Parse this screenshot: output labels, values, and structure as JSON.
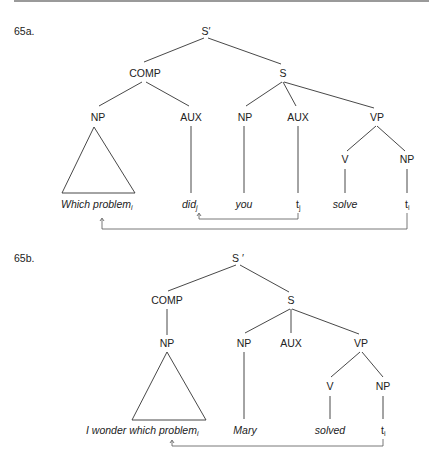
{
  "examples": [
    {
      "label": "65a.",
      "nodes": {
        "root": "S′",
        "comp": "COMP",
        "s": "S",
        "comp_np": "NP",
        "comp_aux": "AUX",
        "s_np": "NP",
        "s_aux": "AUX",
        "vp": "VP",
        "v": "V",
        "vp_np": "NP"
      },
      "leaves": {
        "which_problem": "Which problem",
        "which_problem_sub": "i",
        "did": "did",
        "did_sub": "j",
        "you": "you",
        "trace_aux": "t",
        "trace_aux_sub": "j",
        "solve": "solve",
        "trace_np": "t",
        "trace_np_sub": "i"
      }
    },
    {
      "label": "65b.",
      "nodes": {
        "root": "S ′",
        "comp": "COMP",
        "s": "S",
        "comp_np": "NP",
        "s_np": "NP",
        "s_aux": "AUX",
        "vp": "VP",
        "v": "V",
        "vp_np": "NP"
      },
      "leaves": {
        "i_wonder": "I wonder which problem",
        "i_wonder_sub": "i",
        "mary": "Mary",
        "solved": "solved",
        "trace_np": "t",
        "trace_np_sub": "i"
      }
    }
  ]
}
